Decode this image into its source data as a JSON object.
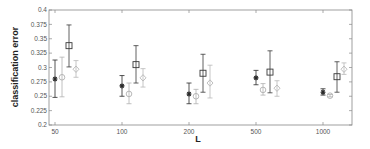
{
  "chart_data": {
    "type": "scatter",
    "subtype": "errorbar",
    "title": "",
    "xlabel": "L",
    "ylabel": "classification error",
    "categories": [
      "50",
      "100",
      "200",
      "500",
      "1000"
    ],
    "ylim": [
      0.2,
      0.4
    ],
    "yticks": [
      "0.2",
      "0.225",
      "0.25",
      "0.275",
      "0.3",
      "0.325",
      "0.35",
      "0.375",
      "0.4"
    ],
    "grid": false,
    "legend": null,
    "series": [
      {
        "name": "series-1",
        "marker": "star",
        "color": "#2a2a2a",
        "values": [
          0.28,
          0.268,
          0.254,
          0.282,
          0.257
        ],
        "err_low": [
          0.248,
          0.25,
          0.237,
          0.27,
          0.252
        ],
        "err_high": [
          0.313,
          0.286,
          0.273,
          0.295,
          0.263
        ]
      },
      {
        "name": "series-2",
        "marker": "circle",
        "color": "#b0b0b0",
        "values": [
          0.283,
          0.254,
          0.25,
          0.261,
          0.251
        ],
        "err_low": [
          0.249,
          0.237,
          0.237,
          0.252,
          0.249
        ],
        "err_high": [
          0.318,
          0.273,
          0.262,
          0.272,
          0.253
        ]
      },
      {
        "name": "series-3",
        "marker": "square",
        "color": "#3a3a3a",
        "values": [
          0.338,
          0.305,
          0.29,
          0.292,
          0.284
        ],
        "err_low": [
          0.301,
          0.273,
          0.257,
          0.256,
          0.257
        ],
        "err_high": [
          0.374,
          0.338,
          0.323,
          0.329,
          0.31
        ]
      },
      {
        "name": "series-4",
        "marker": "diamond",
        "color": "#b8b8b8",
        "values": [
          0.297,
          0.282,
          0.273,
          0.264,
          0.297
        ],
        "err_low": [
          0.283,
          0.266,
          0.247,
          0.25,
          0.288
        ],
        "err_high": [
          0.312,
          0.298,
          0.304,
          0.277,
          0.308
        ]
      }
    ]
  }
}
